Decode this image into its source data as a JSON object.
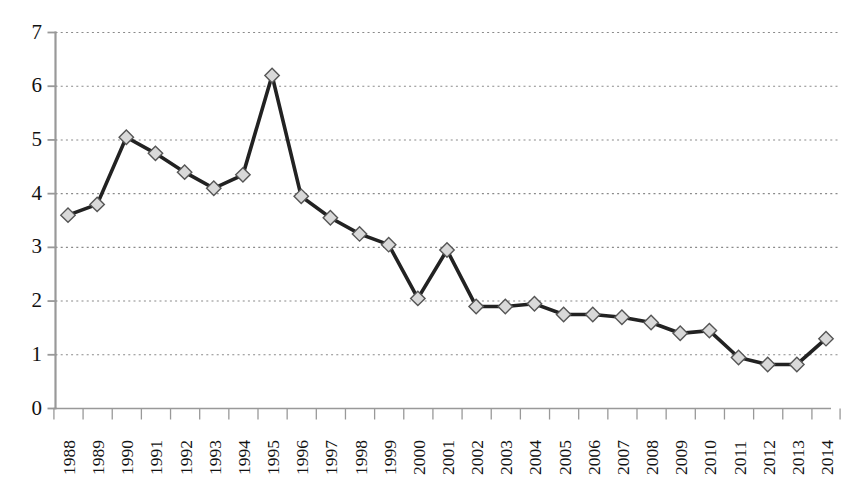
{
  "chart_data": {
    "type": "line",
    "title": "",
    "subtitle": "",
    "xlabel": "",
    "ylabel": "",
    "categories": [
      "1988",
      "1989",
      "1990",
      "1991",
      "1992",
      "1993",
      "1994",
      "1995",
      "1996",
      "1997",
      "1998",
      "1999",
      "2000",
      "2001",
      "2002",
      "2003",
      "2004",
      "2005",
      "2006",
      "2007",
      "2008",
      "2009",
      "2010",
      "2011",
      "2012",
      "2013",
      "2014"
    ],
    "values": [
      3.6,
      3.8,
      5.05,
      4.75,
      4.4,
      4.1,
      4.35,
      6.2,
      3.95,
      3.55,
      3.25,
      3.05,
      2.05,
      2.95,
      1.9,
      1.9,
      1.95,
      1.75,
      1.75,
      1.7,
      1.6,
      1.4,
      1.45,
      0.95,
      0.82,
      0.82,
      1.3
    ],
    "series": [
      {
        "name": "series-1",
        "values": [
          3.6,
          3.8,
          5.05,
          4.75,
          4.4,
          4.1,
          4.35,
          6.2,
          3.95,
          3.55,
          3.25,
          3.05,
          2.05,
          2.95,
          1.9,
          1.9,
          1.95,
          1.75,
          1.75,
          1.7,
          1.6,
          1.4,
          1.45,
          0.95,
          0.82,
          0.82,
          1.3
        ],
        "line_color": "#222222",
        "marker": "diamond",
        "marker_fill": "#d9d9d9",
        "marker_edge": "#555555"
      }
    ],
    "ylim": [
      0,
      7
    ],
    "yticks": [
      0,
      1,
      2,
      3,
      4,
      5,
      6,
      7
    ],
    "ytick_labels": [
      "0",
      "1",
      "2",
      "3",
      "4",
      "5",
      "6",
      "7"
    ],
    "grid": true,
    "grid_style": "dotted-horizontal",
    "grid_color": "#8a8a8a",
    "legend": false,
    "legend_position": "none",
    "axis_color": "#999999",
    "background": "#ffffff"
  },
  "axes": {
    "y_axis_name": "value-axis",
    "x_axis_name": "year-axis"
  }
}
